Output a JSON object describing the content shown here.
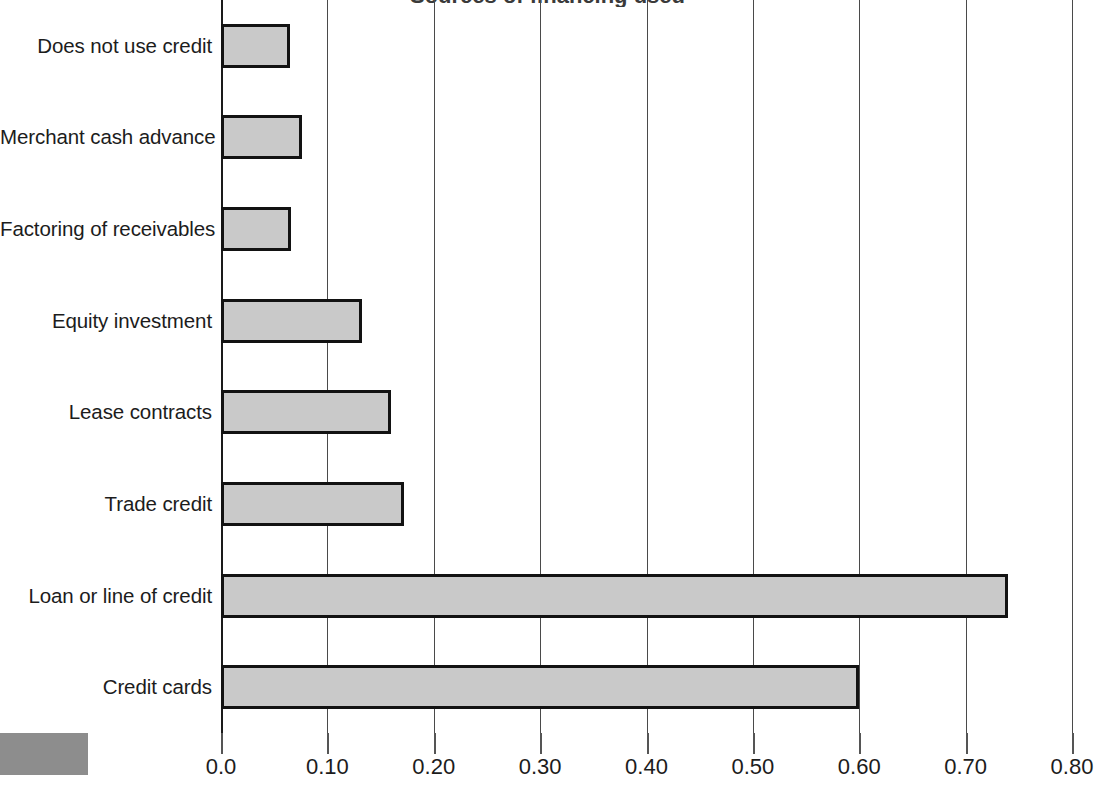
{
  "chart_data": {
    "type": "bar",
    "orientation": "horizontal",
    "title": "Sources of financing used",
    "xlabel": "",
    "ylabel": "",
    "xlim": [
      0.0,
      0.8
    ],
    "grid": true,
    "legend_position": "none",
    "categories": [
      "Does not use credit",
      "Merchant cash advance",
      "Factoring of receivables",
      "Equity investment",
      "Lease contracts",
      "Trade credit",
      "Loan or line of credit",
      "Credit cards"
    ],
    "values": [
      0.065,
      0.076,
      0.066,
      0.133,
      0.16,
      0.172,
      0.74,
      0.6
    ],
    "tick_values": [
      0.0,
      0.1,
      0.2,
      0.3,
      0.4,
      0.5,
      0.6,
      0.7,
      0.8
    ],
    "tick_labels": [
      "0.0",
      "0.10",
      "0.20",
      "0.30",
      "0.40",
      "0.50",
      "0.60",
      "0.70",
      "0.80"
    ],
    "bar_fill_color": "#c9c9c9",
    "bar_border_color": "#121212",
    "gridline_color": "#4a4a4a",
    "legend_swatch_color": "#8d8d8d"
  }
}
